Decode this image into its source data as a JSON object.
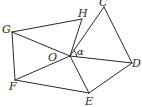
{
  "diagram": {
    "points": {
      "O": {
        "x": 70,
        "y": 56
      },
      "C": {
        "x": 104,
        "y": 7
      },
      "D": {
        "x": 132,
        "y": 63
      },
      "E": {
        "x": 89,
        "y": 93
      },
      "F": {
        "x": 15,
        "y": 80
      },
      "G": {
        "x": 12,
        "y": 32
      },
      "H": {
        "x": 82,
        "y": 19
      }
    },
    "labels": {
      "C": "C",
      "D": "D",
      "E": "E",
      "F": "F",
      "G": "G",
      "H": "H",
      "O": "O",
      "angle": "α"
    },
    "segments": [
      [
        "G",
        "H"
      ],
      [
        "H",
        "O"
      ],
      [
        "G",
        "O"
      ],
      [
        "G",
        "F"
      ],
      [
        "F",
        "O"
      ],
      [
        "F",
        "E"
      ],
      [
        "O",
        "E"
      ],
      [
        "E",
        "D"
      ],
      [
        "O",
        "D"
      ],
      [
        "D",
        "C"
      ],
      [
        "O",
        "C"
      ]
    ],
    "colors": {
      "stroke": "#2a2a2a",
      "background": "#ffffff"
    }
  }
}
